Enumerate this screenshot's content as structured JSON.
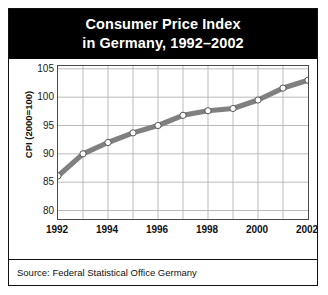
{
  "title": {
    "line1": "Consumer Price Index",
    "line2": "in Germany, 1992–2002"
  },
  "source": "Source: Federal Statistical Office Germany",
  "colors": {
    "title_band_bg": "#000000",
    "title_text": "#ffffff",
    "line": "#808080",
    "marker_fill": "#ffffff",
    "marker_stroke": "#595959",
    "grid": "#b3b3b3",
    "axis": "#4a4a4a",
    "plot_bg": "#ffffff",
    "figure_border": "#111111"
  },
  "chart_data": {
    "type": "line",
    "title": "Consumer Price Index in Germany, 1992–2002",
    "xlabel": "",
    "ylabel": "CPI (2000=100)",
    "x": [
      1992,
      1993,
      1994,
      1995,
      1996,
      1997,
      1998,
      1999,
      2000,
      2001,
      2002
    ],
    "values": [
      86.1,
      90.0,
      92.0,
      93.7,
      95.0,
      96.8,
      97.6,
      98.0,
      99.5,
      101.6,
      103.0
    ],
    "xlim": [
      1992,
      2002
    ],
    "ylim": [
      78.5,
      105.5
    ],
    "yticks": [
      105,
      100,
      95,
      90,
      85,
      80
    ],
    "ytick_labels": [
      "105",
      "100",
      "95",
      "90",
      "85",
      "80"
    ],
    "xticks": [
      1992,
      1994,
      1996,
      1998,
      2000,
      2002
    ],
    "xtick_labels": [
      "1992",
      "1994",
      "1996",
      "1998",
      "2000",
      "2002"
    ],
    "grid": true,
    "legend": false,
    "markers": "circle",
    "source": "Source: Federal Statistical Office Germany"
  }
}
